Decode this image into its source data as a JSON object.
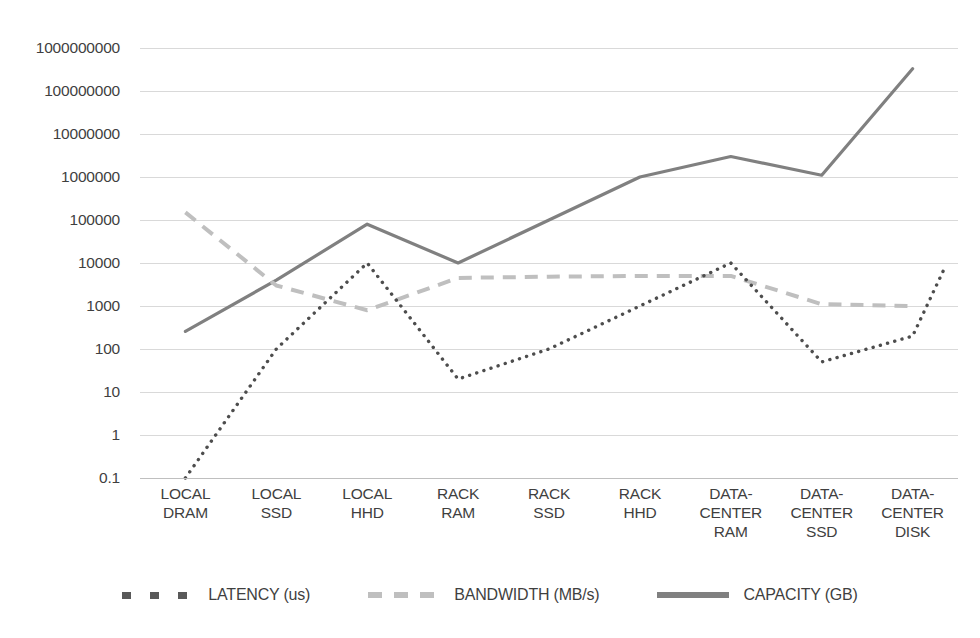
{
  "chart_data": {
    "type": "line",
    "title": "",
    "subtitle": "",
    "xlabel": "",
    "ylabel": "",
    "yscale": "log",
    "ylim": [
      0.1,
      1000000000
    ],
    "grid": true,
    "legend_position": "bottom",
    "categories": [
      "LOCAL DRAM",
      "LOCAL SSD",
      "LOCAL HHD",
      "RACK RAM",
      "RACK SSD",
      "RACK HHD",
      "DATA-CENTER RAM",
      "DATA-CENTER SSD",
      "DATA-CENTER DISK"
    ],
    "category_lines": [
      [
        "LOCAL",
        "DRAM"
      ],
      [
        "LOCAL",
        "SSD"
      ],
      [
        "LOCAL",
        "HHD"
      ],
      [
        "RACK",
        "RAM"
      ],
      [
        "RACK",
        "SSD"
      ],
      [
        "RACK",
        "HHD"
      ],
      [
        "DATA-",
        "CENTER",
        "RAM"
      ],
      [
        "DATA-",
        "CENTER",
        "SSD"
      ],
      [
        "DATA-",
        "CENTER",
        "DISK"
      ]
    ],
    "ytick_labels": [
      "1000000000",
      "100000000",
      "10000000",
      "1000000",
      "100000",
      "10000",
      "1000",
      "100",
      "10",
      "1",
      "0.1"
    ],
    "ytick_values": [
      1000000000,
      100000000,
      10000000,
      1000000,
      100000,
      10000,
      1000,
      100,
      10,
      1,
      0.1
    ],
    "series": [
      {
        "name": "LATENCY (us)",
        "style": "dotted",
        "color": "#595959",
        "values": [
          0.1,
          100,
          10000,
          20,
          100,
          1000,
          10000,
          50,
          200
        ]
      },
      {
        "name": "BANDWIDTH (MB/s)",
        "style": "dashed",
        "color": "#bfbfbf",
        "values": [
          150000,
          3000,
          800,
          4500,
          4800,
          5000,
          5000,
          1100,
          1000
        ]
      },
      {
        "name": "CAPACITY (GB)",
        "style": "solid",
        "color": "#808080",
        "values": [
          256,
          4000,
          80000,
          10000,
          100000,
          1000000,
          3000000,
          1100000,
          330000000
        ]
      }
    ],
    "series_extra": {
      "latency_final_rise": 9000
    }
  },
  "legend": {
    "items": [
      {
        "label": "LATENCY (us)",
        "marker": "dotted-marker",
        "color": "#595959"
      },
      {
        "label": "BANDWIDTH (MB/s)",
        "marker": "dashed-marker",
        "color": "#bfbfbf"
      },
      {
        "label": "CAPACITY (GB)",
        "marker": "solid-marker",
        "color": "#808080"
      }
    ]
  },
  "colors": {
    "background": "#ffffff",
    "gridline": "#d9d9d9",
    "text": "#3f3f3f",
    "latency": "#595959",
    "bandwidth": "#bfbfbf",
    "capacity": "#808080"
  }
}
